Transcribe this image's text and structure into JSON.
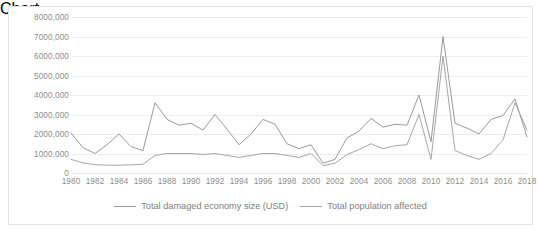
{
  "chart_data": {
    "type": "line",
    "title": "",
    "xlabel": "",
    "ylabel": "",
    "grid": true,
    "legend_position": "bottom",
    "ylim": [
      0,
      8000000
    ],
    "ytick_labels": [
      "8000,000",
      "7000,000",
      "6000,000",
      "5000,000",
      "4000,000",
      "3000,000",
      "2000,000",
      "1000,000",
      "0"
    ],
    "ytick_values": [
      8000000,
      7000000,
      6000000,
      5000000,
      4000000,
      3000000,
      2000000,
      1000000,
      0
    ],
    "xtick_labels": [
      "1980",
      "1982",
      "1984",
      "1986",
      "1988",
      "1990",
      "1992",
      "1994",
      "1996",
      "1998",
      "2000",
      "2002",
      "2004",
      "2006",
      "2008",
      "2010",
      "2012",
      "2014",
      "2016",
      "2018"
    ],
    "x": [
      1980,
      1981,
      1982,
      1983,
      1984,
      1985,
      1986,
      1987,
      1988,
      1989,
      1990,
      1991,
      1992,
      1993,
      1994,
      1995,
      1996,
      1997,
      1998,
      1999,
      2000,
      2001,
      2002,
      2003,
      2004,
      2005,
      2006,
      2007,
      2008,
      2009,
      2010,
      2011,
      2012,
      2013,
      2014,
      2015,
      2016,
      2017,
      2018
    ],
    "series": [
      {
        "name": "Total damaged economy size (USD)",
        "color": "#9a9a9a",
        "values": [
          2050000,
          1300000,
          1000000,
          1450000,
          2000000,
          1350000,
          1150000,
          3600000,
          2750000,
          2450000,
          2550000,
          2200000,
          3000000,
          2250000,
          1450000,
          2000000,
          2750000,
          2500000,
          1500000,
          1250000,
          1450000,
          500000,
          700000,
          1800000,
          2150000,
          2800000,
          2350000,
          2500000,
          2450000,
          4000000,
          1600000,
          7000000,
          2550000,
          2300000,
          2000000,
          2750000,
          2950000,
          3800000,
          1850000
        ]
      },
      {
        "name": "Total population affected",
        "color": "#a6a6a6",
        "values": [
          700000,
          520000,
          430000,
          400000,
          400000,
          420000,
          450000,
          900000,
          1000000,
          1000000,
          1000000,
          950000,
          1000000,
          900000,
          800000,
          900000,
          1000000,
          1000000,
          900000,
          800000,
          1000000,
          380000,
          500000,
          950000,
          1200000,
          1500000,
          1250000,
          1400000,
          1450000,
          3000000,
          700000,
          6000000,
          1150000,
          900000,
          700000,
          1000000,
          1700000,
          3600000,
          2200000
        ]
      }
    ]
  },
  "legend": {
    "items": [
      {
        "label": "Total damaged economy size (USD)"
      },
      {
        "label": "Total population affected"
      }
    ]
  }
}
